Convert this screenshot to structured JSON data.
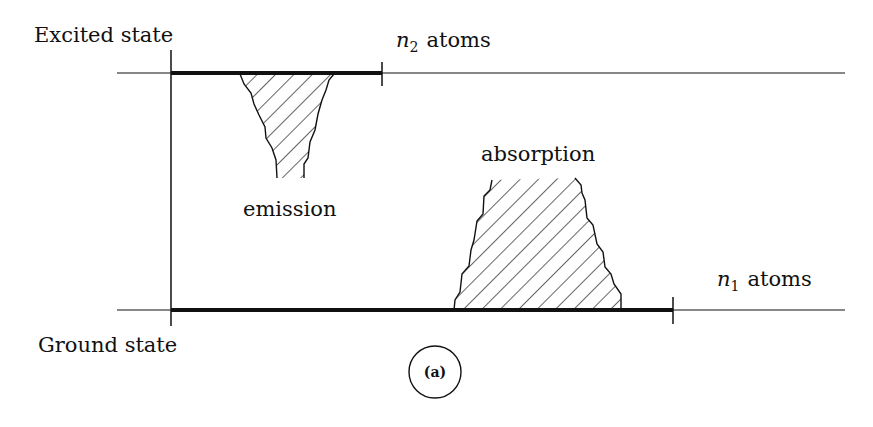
{
  "figure": {
    "panel_label": "(a)",
    "levels": {
      "excited": {
        "label": "Excited state",
        "population_label_var": "n",
        "population_label_sub": "2",
        "population_label_text": "atoms"
      },
      "ground": {
        "label": "Ground state",
        "population_label_var": "n",
        "population_label_sub": "1",
        "population_label_text": "atoms"
      }
    },
    "regions": {
      "emission": {
        "label": "emission"
      },
      "absorption": {
        "label": "absorption"
      }
    }
  }
}
